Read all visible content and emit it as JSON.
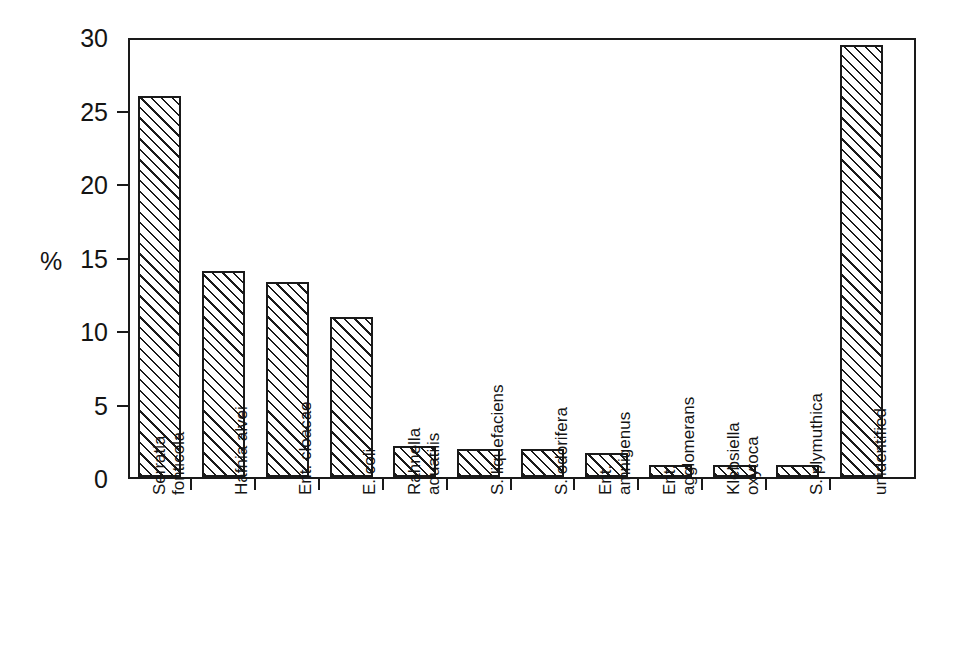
{
  "chart_data": {
    "type": "bar",
    "title": "",
    "xlabel": "",
    "ylabel": "%",
    "ylim": [
      0,
      30
    ],
    "yticks": [
      0,
      5,
      10,
      15,
      20,
      25,
      30
    ],
    "ytick_labels": [
      "0",
      "5",
      "10",
      "15",
      "20",
      "25",
      "30"
    ],
    "grid": false,
    "legend": "none",
    "categories": [
      "Serratia fonticola",
      "Hafnia alvei",
      "Ent. cloacae",
      "E. coli",
      "Rahnella aquatilis",
      "S. liquefaciens",
      "S. odorifera",
      "Ent. amnigenus",
      "Ent. agglomerans",
      "Klebsiella oxytoca",
      "S. plymuthica",
      "unidentified"
    ],
    "category_lines": [
      [
        "Serratia",
        "fonticola"
      ],
      [
        "Hafnia alvei"
      ],
      [
        "Ent. cloacae"
      ],
      [
        "E. coli"
      ],
      [
        "Rahnella",
        "aquatilis"
      ],
      [
        "S. liquefaciens"
      ],
      [
        "S. odorifera"
      ],
      [
        "Ent.",
        "amnigenus"
      ],
      [
        "Ent.",
        "agglomerans"
      ],
      [
        "Klebsiella",
        "oxytoca"
      ],
      [
        "S. plymuthica"
      ],
      [
        "unidentified"
      ]
    ],
    "values": [
      25.9,
      14.0,
      13.3,
      10.9,
      2.1,
      1.9,
      1.9,
      1.6,
      0.8,
      0.8,
      0.8,
      29.4
    ],
    "bar_style": {
      "fill": "#ffffff",
      "hatch": "diagonal-45",
      "edge_color": "#1a1a1a"
    }
  }
}
